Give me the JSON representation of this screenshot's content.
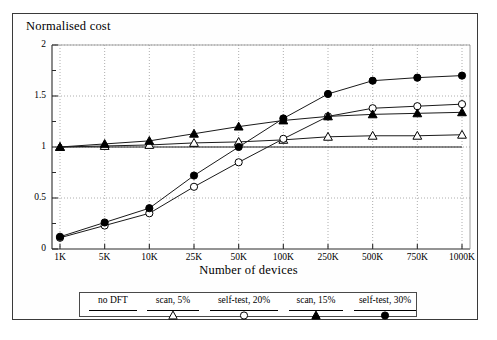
{
  "chart_data": {
    "type": "line",
    "title": "",
    "ylabel": "Normalised cost",
    "xlabel": "Number of devices",
    "categories": [
      "1K",
      "5K",
      "10K",
      "25K",
      "50K",
      "100K",
      "250K",
      "500K",
      "750K",
      "1000K"
    ],
    "ylim": [
      0,
      2
    ],
    "yticks": [
      0,
      0.5,
      1,
      1.5,
      2
    ],
    "ytick_labels": [
      "0",
      "0.5",
      "1",
      "1.5",
      "2"
    ],
    "yminor_ticks": [
      0.25,
      0.75,
      1.25,
      1.75
    ],
    "grid": true,
    "grid_style": "dotted",
    "legend_position": "below-axes",
    "series": [
      {
        "name": "no DFT",
        "marker": "none",
        "values": [
          1.0,
          1.0,
          1.0,
          1.0,
          1.0,
          1.0,
          1.0,
          1.0,
          1.0,
          1.0
        ]
      },
      {
        "name": "scan, 5%",
        "marker": "open-triangle",
        "values": [
          1.0,
          1.01,
          1.02,
          1.04,
          1.05,
          1.07,
          1.1,
          1.11,
          1.11,
          1.12
        ]
      },
      {
        "name": "self-test, 20%",
        "marker": "open-circle",
        "values": [
          0.11,
          0.23,
          0.35,
          0.61,
          0.85,
          1.08,
          1.3,
          1.38,
          1.4,
          1.42
        ]
      },
      {
        "name": "scan, 15%",
        "marker": "filled-triangle",
        "values": [
          1.0,
          1.03,
          1.06,
          1.13,
          1.2,
          1.26,
          1.3,
          1.32,
          1.33,
          1.34
        ]
      },
      {
        "name": "self-test, 30%",
        "marker": "filled-circle",
        "values": [
          0.12,
          0.26,
          0.4,
          0.72,
          1.0,
          1.28,
          1.52,
          1.65,
          1.68,
          1.7
        ]
      }
    ]
  },
  "legend": {
    "entries": [
      {
        "label": "no DFT",
        "marker": "none"
      },
      {
        "label": "scan, 5%",
        "marker": "open-triangle"
      },
      {
        "label": "self-test, 20%",
        "marker": "open-circle"
      },
      {
        "label": "scan, 15%",
        "marker": "filled-triangle"
      },
      {
        "label": "self-test, 30%",
        "marker": "filled-circle"
      }
    ]
  },
  "colors": {
    "line": "#000000",
    "grid": "#999999",
    "frame": "#3a3a3a",
    "background": "#ffffff"
  }
}
